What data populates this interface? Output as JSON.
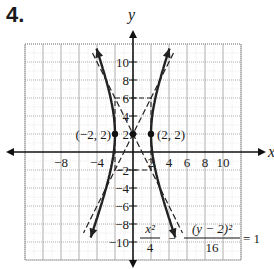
{
  "problem_number": "4.",
  "chart_data": {
    "type": "line",
    "title": "",
    "xlabel": "x",
    "ylabel": "y",
    "xlim": [
      -12,
      12
    ],
    "ylim": [
      -12,
      12
    ],
    "grid": true,
    "grid_step": 2,
    "x_tick_labels": [
      "-8",
      "-4",
      "2",
      "4",
      "6",
      "8",
      "10"
    ],
    "x_ticks": [
      -8,
      -4,
      2,
      4,
      6,
      8,
      10
    ],
    "y_tick_labels": [
      "10",
      "8",
      "6",
      "4",
      "2",
      "-2",
      "-4",
      "-6",
      "-8",
      "-10"
    ],
    "y_ticks": [
      10,
      8,
      6,
      4,
      2,
      -2,
      -4,
      -6,
      -8,
      -10
    ],
    "equation": {
      "lhs_term1_num": "x²",
      "lhs_term1_den": "4",
      "minus": "−",
      "lhs_term2_num": "(y − 2)²",
      "lhs_term2_den": "16",
      "rhs": "= 1"
    },
    "center": [
      0,
      2
    ],
    "vertices": [
      [
        -2,
        2
      ],
      [
        2,
        2
      ]
    ],
    "points": [
      {
        "label": "(−2, 2)",
        "x": -2,
        "y": 2
      },
      {
        "label": "(2, 2)",
        "x": 2,
        "y": 2
      },
      {
        "label": "",
        "x": 0,
        "y": 2
      }
    ],
    "series": [
      {
        "name": "hyperbola-right-branch",
        "style": "solid",
        "x": [
          3.6,
          3.0,
          2.5,
          2.2,
          2.0,
          2.2,
          2.5,
          3.0,
          3.6
        ],
        "y": [
          -10,
          -6,
          -3,
          0,
          2,
          4,
          7,
          10,
          12
        ]
      },
      {
        "name": "hyperbola-left-branch",
        "style": "solid",
        "x": [
          -3.6,
          -3.0,
          -2.5,
          -2.2,
          -2.0,
          -2.2,
          -2.5,
          -3.0,
          -3.6
        ],
        "y": [
          -10,
          -6,
          -3,
          0,
          2,
          4,
          7,
          10,
          12
        ]
      },
      {
        "name": "asymptote-1",
        "style": "dashed",
        "equation": "y = 2x + 2"
      },
      {
        "name": "asymptote-2",
        "style": "dashed",
        "equation": "y = -2x + 2"
      }
    ],
    "fundamental_rectangle": {
      "x": [
        -2,
        2
      ],
      "y": [
        -2,
        6
      ],
      "style": "dashed"
    }
  }
}
